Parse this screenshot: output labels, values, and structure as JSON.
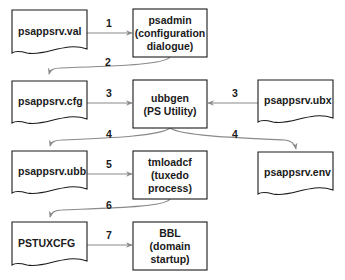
{
  "diagram": {
    "type": "flowchart",
    "nodes": [
      {
        "id": "val",
        "kind": "document",
        "lines": [
          "psappsrv.val"
        ],
        "align": "left"
      },
      {
        "id": "psadmin",
        "kind": "process",
        "lines": [
          "psadmin",
          "(configuration",
          "dialogue)"
        ],
        "align": "center"
      },
      {
        "id": "cfg",
        "kind": "document",
        "lines": [
          "psappsrv.cfg"
        ],
        "align": "left"
      },
      {
        "id": "ubbgen",
        "kind": "process",
        "lines": [
          "ubbgen",
          "(PS Utility)"
        ],
        "align": "center"
      },
      {
        "id": "ubx",
        "kind": "document",
        "lines": [
          "psappsrv.ubx"
        ],
        "align": "left"
      },
      {
        "id": "ubb",
        "kind": "document",
        "lines": [
          "psappsrv.ubb"
        ],
        "align": "left"
      },
      {
        "id": "tmloadcf",
        "kind": "process",
        "lines": [
          "tmloadcf",
          "(tuxedo",
          "process)"
        ],
        "align": "center"
      },
      {
        "id": "env",
        "kind": "document",
        "lines": [
          "psappsrv.env"
        ],
        "align": "left"
      },
      {
        "id": "pstuxcfg",
        "kind": "document",
        "lines": [
          "PSTUXCFG"
        ],
        "align": "left"
      },
      {
        "id": "bbl",
        "kind": "process",
        "lines": [
          "BBL",
          "(domain",
          "startup)"
        ],
        "align": "center"
      }
    ],
    "edges": [
      {
        "from": "val",
        "to": "psadmin",
        "label": "1",
        "style": "straight"
      },
      {
        "from": "psadmin",
        "to": "cfg",
        "label": "2",
        "style": "curved"
      },
      {
        "from": "cfg",
        "to": "ubbgen",
        "label": "3",
        "style": "straight"
      },
      {
        "from": "ubx",
        "to": "ubbgen",
        "label": "3",
        "style": "straight"
      },
      {
        "from": "ubbgen",
        "to": "ubb",
        "label": "4",
        "style": "curved"
      },
      {
        "from": "ubbgen",
        "to": "env",
        "label": "4",
        "style": "curved"
      },
      {
        "from": "ubb",
        "to": "tmloadcf",
        "label": "5",
        "style": "straight"
      },
      {
        "from": "tmloadcf",
        "to": "pstuxcfg",
        "label": "6",
        "style": "curved"
      },
      {
        "from": "pstuxcfg",
        "to": "bbl",
        "label": "7",
        "style": "straight"
      }
    ],
    "colors": {
      "node_stroke": "#1a1a1a",
      "node_fill": "#ffffff",
      "edge_stroke": "#8a8a8a",
      "text": "#1a1a1a"
    }
  }
}
